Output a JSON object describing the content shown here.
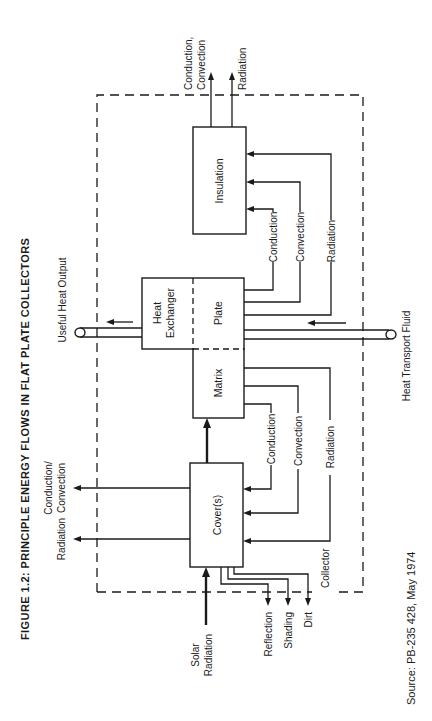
{
  "figure": {
    "title": "FIGURE 1.2:  PRINCIPLE ENERGY FLOWS IN FLAT PLATE COLLECTORS",
    "source": "Source:  PB-235 428, May 1974",
    "orientation": "rotated 90° counter-clockwise"
  },
  "boundary": {
    "label": "Collector"
  },
  "components": {
    "insulation": "Insulation",
    "heat_exchanger_line1": "Heat",
    "heat_exchanger_line2": "Exchanger",
    "plate": "Plate",
    "matrix": "Matrix",
    "covers": "Cover(s)"
  },
  "flows": {
    "useful_heat_output": "Useful Heat Output",
    "heat_transport_fluid": "Heat Transport Fluid",
    "solar_radiation_line1": "Solar",
    "solar_radiation_line2": "Radiation",
    "reflection": "Reflection",
    "shading": "Shading",
    "dirt": "Dirt",
    "insulation_out_cc_line1": "Conduction,",
    "insulation_out_cc_line2": "Convection",
    "insulation_out_radiation": "Radiation",
    "cover_out_cc_line1": "Conduction/",
    "cover_out_cc_line2": "Convection",
    "cover_out_radiation": "Radiation",
    "plate_to_insulation": [
      "Conduction",
      "Convection",
      "Radiation"
    ],
    "matrix_to_cover": [
      "Conduction",
      "Convection",
      "Radiation"
    ]
  }
}
